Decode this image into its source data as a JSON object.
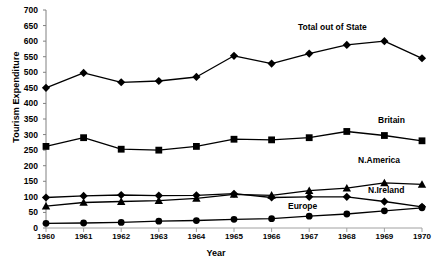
{
  "chart_data": {
    "type": "line",
    "title": "",
    "xlabel": "Year",
    "ylabel": "Tourism Expenditure",
    "x": [
      1960,
      1961,
      1962,
      1963,
      1964,
      1965,
      1966,
      1967,
      1968,
      1969,
      1970
    ],
    "xtick_labels": [
      "1960",
      "1961",
      "1962",
      "1963",
      "1964",
      "1965",
      "1966",
      "1967",
      "1968",
      "1969",
      "1970"
    ],
    "ylim": [
      0,
      700
    ],
    "ytick_labels": [
      "0",
      "50",
      "100",
      "150",
      "200",
      "250",
      "300",
      "350",
      "400",
      "450",
      "500",
      "550",
      "600",
      "650",
      "700"
    ],
    "ytick_values": [
      0,
      50,
      100,
      150,
      200,
      250,
      300,
      350,
      400,
      450,
      500,
      550,
      600,
      650,
      700
    ],
    "grid": false,
    "legend": "inline-annotations",
    "series": [
      {
        "name": "Total out of State",
        "marker": "diamond",
        "label": "Total out of State",
        "values": [
          450,
          498,
          468,
          472,
          485,
          553,
          528,
          560,
          588,
          600,
          545
        ]
      },
      {
        "name": "Britain",
        "marker": "square",
        "label": "Britain",
        "values": [
          262,
          290,
          253,
          250,
          262,
          285,
          283,
          290,
          310,
          297,
          280
        ]
      },
      {
        "name": "N.America",
        "marker": "triangle",
        "label": "N.America",
        "values": [
          70,
          82,
          85,
          88,
          95,
          108,
          105,
          120,
          128,
          145,
          140
        ]
      },
      {
        "name": "N.Ireland",
        "marker": "diamond",
        "label": "N.Ireland",
        "values": [
          98,
          103,
          106,
          104,
          105,
          110,
          98,
          100,
          100,
          85,
          68
        ]
      },
      {
        "name": "Europe",
        "marker": "circle",
        "label": "Europe",
        "values": [
          15,
          16,
          18,
          22,
          24,
          28,
          30,
          38,
          45,
          55,
          65
        ]
      }
    ]
  }
}
